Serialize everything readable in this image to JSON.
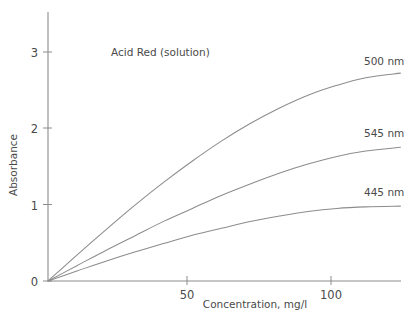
{
  "chart_data": {
    "type": "line",
    "title": "Acid Red (solution)",
    "xlabel": "Concentration, mg/l",
    "ylabel": "Absorbance",
    "xlim": [
      0,
      122.2
    ],
    "ylim": [
      0,
      3.52
    ],
    "xticks": [
      50,
      100
    ],
    "xtick_labels": [
      "50",
      "100"
    ],
    "yticks": [
      0,
      1,
      2,
      3
    ],
    "ytick_labels": [
      "0",
      "1",
      "2",
      "3"
    ],
    "grid": false,
    "legend_position": "inline-right-of-curve-ends",
    "series": [
      {
        "name": "500 nm",
        "label": "500 nm",
        "color": "#8c8c8c",
        "x": [
          0,
          10,
          20,
          30,
          40,
          50,
          60,
          70,
          80,
          90,
          100,
          110,
          122
        ],
        "y": [
          0,
          0.34,
          0.67,
          0.99,
          1.29,
          1.57,
          1.83,
          2.06,
          2.26,
          2.43,
          2.56,
          2.66,
          2.72
        ]
      },
      {
        "name": "545 nm",
        "label": "545 nm",
        "color": "#8c8c8c",
        "x": [
          0,
          10,
          20,
          30,
          40,
          50,
          60,
          70,
          80,
          90,
          100,
          110,
          122
        ],
        "y": [
          0,
          0.2,
          0.4,
          0.59,
          0.78,
          0.95,
          1.12,
          1.27,
          1.41,
          1.53,
          1.63,
          1.7,
          1.75
        ]
      },
      {
        "name": "445 nm",
        "label": "445 nm",
        "color": "#8c8c8c",
        "x": [
          0,
          10,
          20,
          30,
          40,
          50,
          60,
          70,
          80,
          90,
          100,
          110,
          122
        ],
        "y": [
          0,
          0.13,
          0.26,
          0.38,
          0.49,
          0.6,
          0.69,
          0.78,
          0.85,
          0.91,
          0.95,
          0.97,
          0.98
        ]
      }
    ],
    "series_label_positions": [
      {
        "label": "500 nm",
        "x": 364,
        "y": 65
      },
      {
        "label": "545 nm",
        "x": 364,
        "y": 137
      },
      {
        "label": "445 nm",
        "x": 364,
        "y": 196
      }
    ],
    "axis_color": "#8c8c8c",
    "text_color": "#4a4a4a",
    "background": "#ffffff"
  }
}
